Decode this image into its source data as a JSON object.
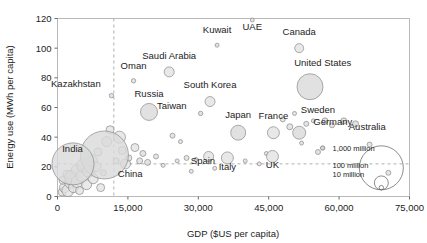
{
  "chart_data": {
    "type": "scatter",
    "title": "",
    "subtitle": "",
    "xlabel": "GDP ($US per capita)",
    "ylabel": "Energy use (MWh per capita)",
    "xlim": [
      0,
      75000
    ],
    "ylim": [
      0,
      120
    ],
    "xticks": [
      "0",
      "15,000",
      "30,000",
      "45,000",
      "60,000",
      "75,000"
    ],
    "xtick_values": [
      0,
      15000,
      30000,
      45000,
      60000,
      75000
    ],
    "yticks": [
      "0",
      "20",
      "40",
      "60",
      "80",
      "100",
      "120"
    ],
    "ytick_values": [
      0,
      20,
      40,
      60,
      80,
      100,
      120
    ],
    "grid": false,
    "legend_position": "inside-lower-right",
    "size_encoding": "population",
    "annotations": [
      {
        "kind": "vertical-reference-line",
        "x": 12000,
        "style": "dashed"
      },
      {
        "kind": "horizontal-reference-line",
        "y": 22,
        "style": "dashed"
      }
    ],
    "legend": {
      "title": "",
      "entries": [
        {
          "label": "1,000 million",
          "value": 1000
        },
        {
          "label": "100 million",
          "value": 100
        },
        {
          "label": "10 million",
          "value": 10
        }
      ]
    },
    "labeled_points": [
      {
        "name": "Kazakhstan",
        "x": 11500,
        "y": 68,
        "r": 2.2,
        "label_x": 9200,
        "label_y": 74,
        "label_anchor": "end"
      },
      {
        "name": "Oman",
        "x": 16200,
        "y": 78,
        "r": 2.2,
        "label_x": 16200,
        "label_y": 86,
        "label_anchor": "middle"
      },
      {
        "name": "Russia",
        "x": 19500,
        "y": 57,
        "r": 8.5,
        "label_x": 19500,
        "label_y": 67,
        "label_anchor": "middle"
      },
      {
        "name": "Saudi Arabia",
        "x": 23800,
        "y": 84,
        "r": 5.0,
        "label_x": 23800,
        "label_y": 93,
        "label_anchor": "middle"
      },
      {
        "name": "Kuwait",
        "x": 34000,
        "y": 102,
        "r": 2.0,
        "label_x": 34000,
        "label_y": 110,
        "label_anchor": "middle"
      },
      {
        "name": "UAE",
        "x": 41500,
        "y": 119,
        "r": 2.0,
        "label_x": 41500,
        "label_y": 112,
        "label_anchor": "middle"
      },
      {
        "name": "Canada",
        "x": 51500,
        "y": 100,
        "r": 4.5,
        "label_x": 51500,
        "label_y": 109,
        "label_anchor": "middle"
      },
      {
        "name": "South Korea",
        "x": 32500,
        "y": 64,
        "r": 5.0,
        "label_x": 32500,
        "label_y": 73,
        "label_anchor": "middle"
      },
      {
        "name": "Taiwan",
        "x": 30500,
        "y": 56,
        "r": 2.2,
        "label_x": 27500,
        "label_y": 59,
        "label_anchor": "end"
      },
      {
        "name": "Japan",
        "x": 38500,
        "y": 43,
        "r": 7.5,
        "label_x": 38500,
        "label_y": 53,
        "label_anchor": "middle"
      },
      {
        "name": "France",
        "x": 46000,
        "y": 43,
        "r": 6.0,
        "label_x": 46000,
        "label_y": 52,
        "label_anchor": "middle"
      },
      {
        "name": "Germany",
        "x": 51500,
        "y": 43,
        "r": 6.5,
        "label_x": 54500,
        "label_y": 48,
        "label_anchor": "start"
      },
      {
        "name": "Sweden",
        "x": 57000,
        "y": 51,
        "r": 3.0,
        "label_x": 55500,
        "label_y": 56,
        "label_anchor": "middle"
      },
      {
        "name": "Australia",
        "x": 63500,
        "y": 49,
        "r": 3.0,
        "label_x": 66000,
        "label_y": 45,
        "label_anchor": "middle"
      },
      {
        "name": "United States",
        "x": 53800,
        "y": 74,
        "r": 13.0,
        "label_x": 56500,
        "label_y": 88,
        "label_anchor": "middle"
      },
      {
        "name": "Spain",
        "x": 32200,
        "y": 27,
        "r": 5.0,
        "label_x": 31000,
        "label_y": 22,
        "label_anchor": "middle"
      },
      {
        "name": "Italy",
        "x": 36200,
        "y": 26,
        "r": 6.0,
        "label_x": 36200,
        "label_y": 18,
        "label_anchor": "middle"
      },
      {
        "name": "UK",
        "x": 45800,
        "y": 27,
        "r": 6.0,
        "label_x": 45800,
        "label_y": 19,
        "label_anchor": "middle"
      },
      {
        "name": "China",
        "x": 10000,
        "y": 28,
        "r": 24.0,
        "label_x": 15500,
        "label_y": 13,
        "label_anchor": "middle"
      },
      {
        "name": "India",
        "x": 3300,
        "y": 22,
        "r": 21.0,
        "label_x": 3200,
        "label_y": 30,
        "label_anchor": "middle"
      }
    ],
    "unlabeled_points": [
      {
        "x": 1000,
        "y": 3,
        "r": 4
      },
      {
        "x": 1500,
        "y": 6,
        "r": 5
      },
      {
        "x": 1200,
        "y": 11,
        "r": 4
      },
      {
        "x": 2200,
        "y": 4,
        "r": 6
      },
      {
        "x": 2600,
        "y": 9,
        "r": 5
      },
      {
        "x": 2000,
        "y": 15,
        "r": 4
      },
      {
        "x": 3000,
        "y": 13,
        "r": 7
      },
      {
        "x": 3400,
        "y": 6,
        "r": 5
      },
      {
        "x": 4200,
        "y": 10,
        "r": 6
      },
      {
        "x": 4000,
        "y": 18,
        "r": 5
      },
      {
        "x": 4700,
        "y": 4,
        "r": 4
      },
      {
        "x": 5200,
        "y": 14,
        "r": 6
      },
      {
        "x": 5600,
        "y": 21,
        "r": 7
      },
      {
        "x": 6200,
        "y": 8,
        "r": 5
      },
      {
        "x": 6600,
        "y": 17,
        "r": 6
      },
      {
        "x": 7200,
        "y": 24,
        "r": 6
      },
      {
        "x": 7600,
        "y": 12,
        "r": 5
      },
      {
        "x": 8200,
        "y": 20,
        "r": 5
      },
      {
        "x": 8600,
        "y": 30,
        "r": 4
      },
      {
        "x": 9200,
        "y": 6,
        "r": 4
      },
      {
        "x": 9800,
        "y": 16,
        "r": 3
      },
      {
        "x": 10500,
        "y": 37,
        "r": 5
      },
      {
        "x": 11200,
        "y": 45,
        "r": 4
      },
      {
        "x": 12500,
        "y": 24,
        "r": 3
      },
      {
        "x": 13200,
        "y": 40,
        "r": 6
      },
      {
        "x": 13800,
        "y": 31,
        "r": 4
      },
      {
        "x": 14500,
        "y": 22,
        "r": 5
      },
      {
        "x": 15200,
        "y": 26,
        "r": 3
      },
      {
        "x": 16500,
        "y": 33,
        "r": 4
      },
      {
        "x": 17500,
        "y": 24,
        "r": 3
      },
      {
        "x": 18200,
        "y": 29,
        "r": 3
      },
      {
        "x": 19200,
        "y": 23,
        "r": 3
      },
      {
        "x": 21000,
        "y": 27,
        "r": 2.5
      },
      {
        "x": 22500,
        "y": 21,
        "r": 2
      },
      {
        "x": 24500,
        "y": 41,
        "r": 2.5
      },
      {
        "x": 25500,
        "y": 24,
        "r": 2
      },
      {
        "x": 26200,
        "y": 37,
        "r": 2
      },
      {
        "x": 27500,
        "y": 26,
        "r": 2.5
      },
      {
        "x": 28500,
        "y": 17,
        "r": 2
      },
      {
        "x": 29500,
        "y": 25,
        "r": 2
      },
      {
        "x": 33500,
        "y": 19,
        "r": 2
      },
      {
        "x": 40000,
        "y": 24,
        "r": 2
      },
      {
        "x": 43000,
        "y": 22,
        "r": 2
      },
      {
        "x": 44500,
        "y": 29,
        "r": 2
      },
      {
        "x": 48000,
        "y": 52,
        "r": 2.5
      },
      {
        "x": 49500,
        "y": 47,
        "r": 3
      },
      {
        "x": 50500,
        "y": 56,
        "r": 2
      },
      {
        "x": 52000,
        "y": 36,
        "r": 2
      },
      {
        "x": 53000,
        "y": 49,
        "r": 2.5
      },
      {
        "x": 54500,
        "y": 51,
        "r": 2
      },
      {
        "x": 55500,
        "y": 30,
        "r": 2.5
      },
      {
        "x": 58500,
        "y": 48,
        "r": 2.5
      },
      {
        "x": 61000,
        "y": 51,
        "r": 3
      },
      {
        "x": 66500,
        "y": 35,
        "r": 2.5
      },
      {
        "x": 70500,
        "y": 16,
        "r": 2.5
      }
    ]
  }
}
